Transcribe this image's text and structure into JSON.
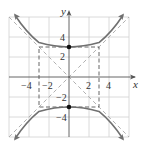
{
  "figure": {
    "type": "hyperbola-graph",
    "equation": "y^2/9 - x^2/9 = 1",
    "axes": {
      "x_label": "x",
      "y_label": "y",
      "x_ticks": [
        {
          "value": -4,
          "label": "−4"
        },
        {
          "value": -2,
          "label": "−2"
        },
        {
          "value": 2,
          "label": "2"
        },
        {
          "value": 4,
          "label": "4"
        }
      ],
      "y_ticks": [
        {
          "value": 4,
          "label": "4"
        },
        {
          "value": 2,
          "label": "2"
        },
        {
          "value": -2,
          "label": "−2"
        },
        {
          "value": -4,
          "label": "−4"
        }
      ],
      "range": [
        -6,
        6
      ],
      "grid_step": 2
    },
    "vertices": [
      [
        0,
        3
      ],
      [
        0,
        -3
      ]
    ],
    "fundamental_rectangle": {
      "x": [
        -3,
        3
      ],
      "y": [
        -3,
        3
      ]
    },
    "asymptotes": [
      "y = x",
      "y = -x"
    ],
    "colors": {
      "curve": "#707070",
      "grid": "#d0d0d0",
      "axis": "#555555",
      "dashed": "#555555",
      "asymptote": "#a8a8a8",
      "vertex": "#111111"
    }
  }
}
